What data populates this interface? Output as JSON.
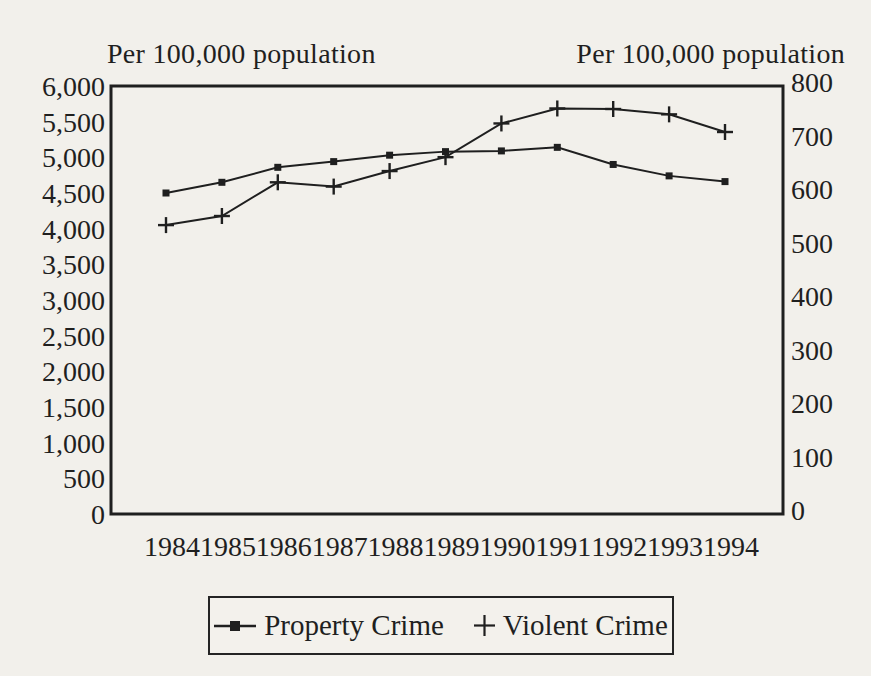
{
  "page": {
    "background_color": "#f2f0eb",
    "ink_color": "#1f1f1f"
  },
  "left_axis_title": "Per 100,000 population",
  "right_axis_title": "Per 100,000 population",
  "chart_data": {
    "type": "line",
    "x_categories": [
      "1984",
      "1985",
      "1986",
      "1987",
      "1988",
      "1989",
      "1990",
      "1991",
      "1992",
      "1993",
      "1994"
    ],
    "left_axis": {
      "title": "Per 100,000 population",
      "min": 0,
      "max": 6000,
      "step": 500,
      "tick_labels": [
        "0",
        "500",
        "1,000",
        "1,500",
        "2,000",
        "2,500",
        "3,000",
        "3,500",
        "4,000",
        "4,500",
        "5,000",
        "5,500",
        "6,000"
      ]
    },
    "right_axis": {
      "title": "Per 100,000 population",
      "min": 0,
      "max": 800,
      "step": 100,
      "tick_labels": [
        "0",
        "100",
        "200",
        "300",
        "400",
        "500",
        "600",
        "700",
        "800"
      ]
    },
    "series": [
      {
        "name": "Property Crime",
        "axis": "left",
        "marker": "square",
        "values": [
          4500,
          4650,
          4860,
          4940,
          5030,
          5080,
          5090,
          5140,
          4900,
          4740,
          4660
        ]
      },
      {
        "name": "Violent Crime",
        "axis": "right",
        "marker": "plus",
        "values": [
          540,
          557,
          620,
          612,
          641,
          667,
          730,
          758,
          757,
          747,
          714
        ]
      }
    ],
    "grid": false,
    "legend_position": "bottom",
    "line_color": "#1f1f1f"
  },
  "legend": {
    "items": [
      {
        "label": "Property Crime",
        "marker": "square-line"
      },
      {
        "label": "Violent Crime",
        "marker": "plus"
      }
    ]
  }
}
